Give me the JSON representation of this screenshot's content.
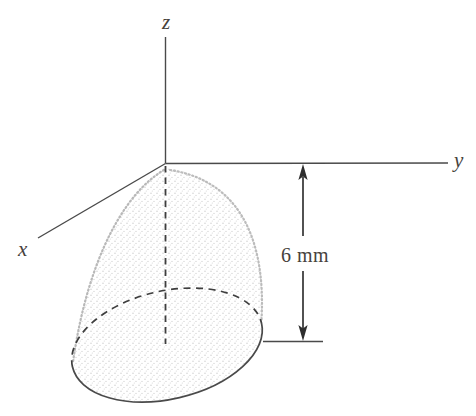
{
  "figure": {
    "axes": {
      "z_label": "z",
      "y_label": "y",
      "x_label": "x"
    },
    "dimension": {
      "label": "6 mm"
    },
    "colors": {
      "background": "#ffffff",
      "line": "#4a4a4a",
      "dashed_line": "#3e3e3e",
      "text": "#46423c",
      "stipple": "#cbcbcb"
    }
  }
}
